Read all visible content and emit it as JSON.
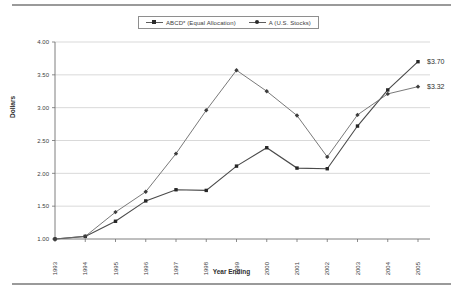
{
  "chart_data": {
    "type": "line",
    "title": "",
    "xlabel": "Year Ending",
    "ylabel": "Dollars",
    "categories": [
      "1993",
      "1994",
      "1995",
      "1996",
      "1997",
      "1998",
      "1999",
      "2000",
      "2001",
      "2002",
      "2003",
      "2004",
      "2005"
    ],
    "ylim": [
      1.0,
      4.0
    ],
    "ytick_step": 0.5,
    "ytick_labels": [
      "4.00",
      "3.50",
      "3.00",
      "2.50",
      "2.00",
      "1.50",
      "1.00"
    ],
    "grid": true,
    "legend_position": "top-center",
    "series": [
      {
        "name": "ABCD* (Equal Allocation)",
        "marker": "square",
        "values": [
          1.0,
          1.04,
          1.27,
          1.58,
          1.75,
          1.74,
          2.11,
          2.39,
          2.08,
          2.07,
          2.72,
          3.27,
          3.7
        ],
        "endpoint_label": "$3.70"
      },
      {
        "name": "A (U.S. Stocks)",
        "marker": "diamond",
        "values": [
          1.0,
          1.04,
          1.41,
          1.72,
          2.3,
          2.96,
          3.57,
          3.25,
          2.88,
          2.25,
          2.89,
          3.21,
          3.32
        ],
        "endpoint_label": "$3.32"
      }
    ],
    "annotations": [
      {
        "text": "$3.70",
        "series": "ABCD* (Equal Allocation)",
        "at": "2005"
      },
      {
        "text": "$3.32",
        "series": "A (U.S. Stocks)",
        "at": "2005"
      }
    ]
  },
  "legend": {
    "entries": [
      {
        "label": "ABCD* (Equal Allocation)"
      },
      {
        "label": "A (U.S. Stocks)"
      }
    ]
  },
  "axes": {
    "y_title": "Dollars",
    "x_title": "Year Ending"
  }
}
